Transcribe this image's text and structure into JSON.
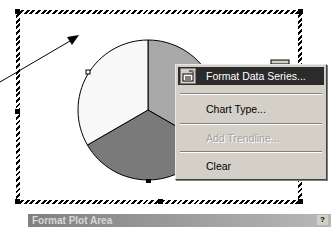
{
  "chart": {
    "type": "pie",
    "slices": [
      {
        "name": "slice-1",
        "fraction": 0.3333,
        "color": "#a8a8a8"
      },
      {
        "name": "slice-2",
        "fraction": 0.3333,
        "color": "#7a7a7a"
      },
      {
        "name": "slice-3",
        "fraction": 0.3333,
        "color": "#f8f8f8"
      }
    ]
  },
  "context_menu": {
    "items": [
      {
        "label": "Format Data Series...",
        "mnemonic": "o",
        "highlighted": true,
        "enabled": true,
        "icon": "format-data-series-icon"
      },
      {
        "label": "Chart Type...",
        "mnemonic": "T",
        "highlighted": false,
        "enabled": true
      },
      {
        "label": "Add Trendline...",
        "mnemonic": "R",
        "highlighted": false,
        "enabled": false
      },
      {
        "label": "Clear",
        "mnemonic": "a",
        "highlighted": false,
        "enabled": true
      }
    ]
  },
  "dialog": {
    "title": "Format Plot Area",
    "help_label": "?"
  },
  "colors": {
    "menu_bg": "#d4d0c8",
    "highlight_bg": "#2b2b2b",
    "highlight_fg": "#ffffff",
    "disabled_fg": "#a0a0a0"
  }
}
